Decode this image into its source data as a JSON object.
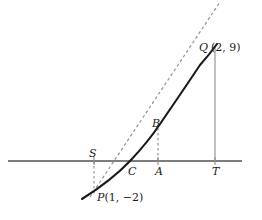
{
  "figure": {
    "type": "geometry-diagram",
    "background_color": "#ffffff",
    "stroke_color": "#1a1a1a",
    "axis_color": "#777777",
    "dash_color": "#8a8a8a",
    "width": 262,
    "height": 220
  },
  "axis": {
    "name": "x-axis",
    "x_start": 8,
    "x_end": 242,
    "y": 161
  },
  "curve": {
    "name": "function-curve",
    "path": "M 82 199 Q 112 180 130 161 Q 148 142 160 124 Q 182 92 200 65 Q 209 55 217 44",
    "stroke_width": 2.1
  },
  "secant": {
    "name": "secant-line",
    "x1": 90,
    "y1": 197,
    "x2": 220,
    "y2": 2,
    "dash": "3,2.6"
  },
  "drop_lines": [
    {
      "name": "drop-line-s-p",
      "x": 94,
      "y1": 161,
      "y2": 195,
      "style": "dashed"
    },
    {
      "name": "drop-line-b-a",
      "x": 158,
      "y1": 128,
      "y2": 163,
      "style": "dashed"
    },
    {
      "name": "drop-line-q-t",
      "x": 215,
      "y1": 47,
      "y2": 161,
      "style": "solid"
    }
  ],
  "axis_ticks": [
    {
      "name": "tick-s",
      "x": 94
    },
    {
      "name": "tick-a",
      "x": 158
    },
    {
      "name": "tick-t",
      "x": 215
    }
  ],
  "points": [
    {
      "id": "Q",
      "label": "Q",
      "x": 215,
      "y": 47,
      "label_x": 199,
      "label_y": 42
    },
    {
      "id": "B",
      "label": "B",
      "x": 158,
      "y": 128,
      "label_x": 152,
      "label_y": 118
    },
    {
      "id": "S",
      "label": "S",
      "x": 94,
      "y": 161,
      "label_x": 89,
      "label_y": 148
    },
    {
      "id": "C",
      "label": "C",
      "x": 130,
      "y": 161,
      "label_x": 128,
      "label_y": 166
    },
    {
      "id": "A",
      "label": "A",
      "x": 158,
      "y": 161,
      "label_x": 155,
      "label_y": 166
    },
    {
      "id": "T",
      "label": "T",
      "x": 215,
      "y": 161,
      "label_x": 212,
      "label_y": 166
    }
  ],
  "coordinate_labels": [
    {
      "id": "Q-coords",
      "name": "Q",
      "coords": "(2, 9)",
      "x": 211,
      "y": 42
    },
    {
      "id": "P-coords",
      "name": "P",
      "coords": "(1, −2)",
      "x": 97,
      "y": 192
    }
  ]
}
